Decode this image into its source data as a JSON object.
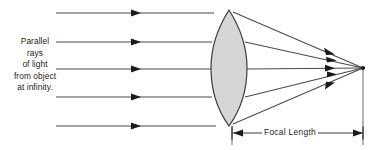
{
  "diagram": {
    "background_color": "#ffffff",
    "width": 376,
    "height": 150
  },
  "caption": {
    "name": "parallel-rays-caption",
    "lines": [
      "Parallel",
      "rays",
      "of light",
      "from object",
      "at infinity."
    ],
    "full_text": "Parallel rays of light from object at infinity.",
    "align": "center",
    "color": "#1a1a1a"
  },
  "lens": {
    "name": "converging-lens",
    "type": "biconvex",
    "fill_color": "#d6d6d6",
    "stroke_color": "#3a3a3a",
    "center_x": 229,
    "top_apex_y": 10,
    "bottom_apex_y": 126,
    "left_edge_x": 211,
    "right_edge_x": 247
  },
  "focal_point": {
    "name": "focal-point",
    "x": 363,
    "y": 68,
    "color": "#1a1a1a"
  },
  "incoming_rays": {
    "count": 5,
    "start_x": 56,
    "arrow_x": 138,
    "color": "#4a4a4a",
    "y_positions": [
      13,
      42,
      69,
      97,
      126
    ],
    "direction": "left-to-right"
  },
  "refracted_rays": {
    "count": 5,
    "color": "#4a4a4a",
    "arrow_x": 330,
    "converge_to": "focal-point",
    "start_y_positions": [
      13,
      42,
      69,
      97,
      126
    ]
  },
  "dimension": {
    "name": "focal-length-dimension",
    "label": "Focal Length",
    "left_x": 232,
    "right_x": 363,
    "y": 133,
    "arrow_style": "double-headed",
    "color": "#3a3a3a"
  },
  "extension_line": {
    "name": "focal-point-extension-line",
    "x": 363,
    "from_y": 68,
    "to_y": 145,
    "color": "#6a6a6a"
  }
}
